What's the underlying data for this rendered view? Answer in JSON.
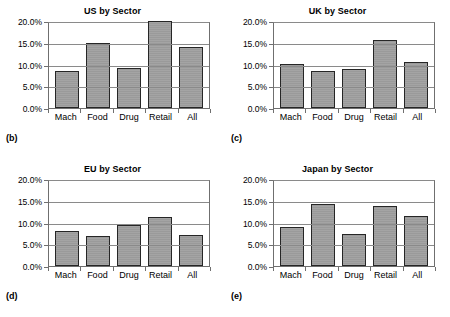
{
  "figure": {
    "background": "#ffffff",
    "bar_fill": "#9a9a9a",
    "bar_stroke": "#262626",
    "grid_color": "#8a8a8a",
    "axis_color": "#6f6f6f"
  },
  "panels": [
    {
      "key": "us",
      "tag": "(b)",
      "chart_data": {
        "type": "bar",
        "title": "US by Sector",
        "xlabel": "",
        "ylabel": "",
        "categories": [
          "Mach",
          "Food",
          "Drug",
          "Retail",
          "All"
        ],
        "values": [
          8.5,
          15.0,
          9.2,
          20.0,
          14.0
        ],
        "ylim": [
          0,
          20
        ],
        "yticks": [
          0,
          5,
          10,
          15,
          20
        ],
        "ytick_labels": [
          "0.0%",
          "5.0%",
          "10.0%",
          "15.0%",
          "20.0%"
        ],
        "grid": true,
        "legend": "none"
      }
    },
    {
      "key": "uk",
      "tag": "(c)",
      "chart_data": {
        "type": "bar",
        "title": "UK by Sector",
        "xlabel": "",
        "ylabel": "",
        "categories": [
          "Mach",
          "Food",
          "Drug",
          "Retail",
          "All"
        ],
        "values": [
          10.2,
          8.4,
          8.9,
          15.7,
          10.5
        ],
        "ylim": [
          0,
          20
        ],
        "yticks": [
          0,
          5,
          10,
          15,
          20
        ],
        "ytick_labels": [
          "0.0%",
          "5.0%",
          "10.0%",
          "15.0%",
          "20.0%"
        ],
        "grid": true,
        "legend": "none"
      }
    },
    {
      "key": "eu",
      "tag": "(d)",
      "chart_data": {
        "type": "bar",
        "title": "EU by Sector",
        "xlabel": "",
        "ylabel": "",
        "categories": [
          "Mach",
          "Food",
          "Drug",
          "Retail",
          "All"
        ],
        "values": [
          8.1,
          6.8,
          9.5,
          11.2,
          7.2
        ],
        "ylim": [
          0,
          20
        ],
        "yticks": [
          0,
          5,
          10,
          15,
          20
        ],
        "ytick_labels": [
          "0.0%",
          "5.0%",
          "10.0%",
          "15.0%",
          "20.0%"
        ],
        "grid": true,
        "legend": "none"
      }
    },
    {
      "key": "japan",
      "tag": "(e)",
      "chart_data": {
        "type": "bar",
        "title": "Japan by Sector",
        "xlabel": "",
        "ylabel": "",
        "categories": [
          "Mach",
          "Food",
          "Drug",
          "Retail",
          "All"
        ],
        "values": [
          8.9,
          14.2,
          7.4,
          13.7,
          11.6
        ],
        "ylim": [
          0,
          20
        ],
        "yticks": [
          0,
          5,
          10,
          15,
          20
        ],
        "ytick_labels": [
          "0.0%",
          "5.0%",
          "10.0%",
          "15.0%",
          "20.0%"
        ],
        "grid": true,
        "legend": "none"
      }
    }
  ]
}
